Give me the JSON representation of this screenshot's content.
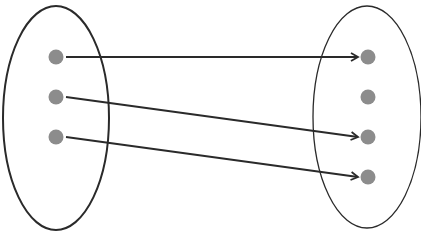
{
  "diagram": {
    "type": "mapping",
    "colors": {
      "stroke": "#2a2a2a",
      "dot": "#8c8c8c",
      "background": "#ffffff"
    },
    "domain_set": {
      "ellipse": {
        "cx": 56,
        "cy": 118,
        "rx": 53,
        "ry": 112
      },
      "points": [
        {
          "id": "a1",
          "x": 56,
          "y": 57
        },
        {
          "id": "a2",
          "x": 56,
          "y": 97
        },
        {
          "id": "a3",
          "x": 56,
          "y": 137
        }
      ]
    },
    "codomain_set": {
      "ellipse": {
        "cx": 367,
        "cy": 117,
        "rx": 54,
        "ry": 111
      },
      "points": [
        {
          "id": "b1",
          "x": 368,
          "y": 57
        },
        {
          "id": "b2",
          "x": 368,
          "y": 97
        },
        {
          "id": "b3",
          "x": 368,
          "y": 137
        },
        {
          "id": "b4",
          "x": 368,
          "y": 177
        }
      ]
    },
    "arrows": [
      {
        "from": "a1",
        "to": "b1"
      },
      {
        "from": "a2",
        "to": "b3"
      },
      {
        "from": "a3",
        "to": "b4"
      }
    ]
  }
}
